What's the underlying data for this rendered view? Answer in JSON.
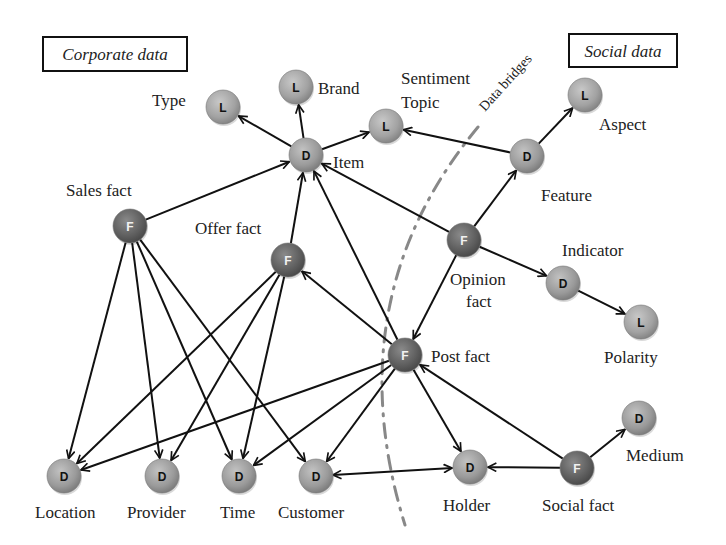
{
  "diagram": {
    "regions": {
      "corporate": {
        "label": "Corporate data",
        "x": 43,
        "y": 37,
        "w": 144,
        "h": 34
      },
      "social": {
        "label": "Social data",
        "x": 569,
        "y": 34,
        "w": 108,
        "h": 33
      }
    },
    "bridge": {
      "label": "Data bridges",
      "points": [
        [
          478,
          127
        ],
        [
          335,
          300
        ],
        [
          405,
          525
        ]
      ],
      "label_x": 485,
      "label_y": 112,
      "label_angle": -48
    },
    "colors": {
      "fact_node": "#6a6a6a",
      "dimension_node": "#a0a0a0",
      "level_node": "#a8a8a8",
      "edge": "#111111",
      "bridge": "#888888",
      "text": "#222222"
    },
    "nodes": [
      {
        "id": "type",
        "kind": "L",
        "letter": "L",
        "x": 223,
        "y": 107,
        "label": "Type",
        "lx": 152,
        "ly": 106
      },
      {
        "id": "brand",
        "kind": "L",
        "letter": "L",
        "x": 296,
        "y": 87,
        "label": "Brand",
        "lx": 318,
        "ly": 94
      },
      {
        "id": "item",
        "kind": "D",
        "letter": "D",
        "x": 306,
        "y": 155,
        "label": "Item",
        "lx": 333,
        "ly": 168
      },
      {
        "id": "sentiment-topic",
        "kind": "L",
        "letter": "L",
        "x": 386,
        "y": 126,
        "label": "Sentiment",
        "label2": "Topic",
        "lx": 401,
        "ly": 84,
        "ly2": 108
      },
      {
        "id": "aspect",
        "kind": "L",
        "letter": "L",
        "x": 585,
        "y": 95,
        "label": "Aspect",
        "lx": 599,
        "ly": 130
      },
      {
        "id": "feature",
        "kind": "D",
        "letter": "D",
        "x": 527,
        "y": 156,
        "label": "Feature",
        "lx": 541,
        "ly": 201
      },
      {
        "id": "sales-fact",
        "kind": "F",
        "letter": "F",
        "x": 130,
        "y": 226,
        "label": "Sales fact",
        "lx": 66,
        "ly": 196
      },
      {
        "id": "offer-fact",
        "kind": "F",
        "letter": "F",
        "x": 288,
        "y": 260,
        "label": "Offer fact",
        "lx": 195,
        "ly": 234
      },
      {
        "id": "opinion-fact",
        "kind": "F",
        "letter": "F",
        "x": 464,
        "y": 240,
        "label": "Opinion",
        "label2": "fact",
        "lx": 450,
        "ly": 285,
        "ly2": 307
      },
      {
        "id": "indicator",
        "kind": "D",
        "letter": "D",
        "x": 563,
        "y": 283,
        "label": "Indicator",
        "lx": 562,
        "ly": 256
      },
      {
        "id": "polarity",
        "kind": "L",
        "letter": "L",
        "x": 641,
        "y": 322,
        "label": "Polarity",
        "lx": 604,
        "ly": 363
      },
      {
        "id": "post-fact",
        "kind": "F",
        "letter": "F",
        "x": 405,
        "y": 355,
        "label": "Post fact",
        "lx": 431,
        "ly": 362
      },
      {
        "id": "location",
        "kind": "D",
        "letter": "D",
        "x": 64,
        "y": 476,
        "label": "Location",
        "lx": 35,
        "ly": 518
      },
      {
        "id": "provider",
        "kind": "D",
        "letter": "D",
        "x": 162,
        "y": 476,
        "label": "Provider",
        "lx": 127,
        "ly": 518
      },
      {
        "id": "time",
        "kind": "D",
        "letter": "D",
        "x": 239,
        "y": 476,
        "label": "Time",
        "lx": 220,
        "ly": 518
      },
      {
        "id": "customer",
        "kind": "D",
        "letter": "D",
        "x": 316,
        "y": 476,
        "label": "Customer",
        "lx": 278,
        "ly": 518
      },
      {
        "id": "holder",
        "kind": "D",
        "letter": "D",
        "x": 470,
        "y": 467,
        "label": "Holder",
        "lx": 443,
        "ly": 511
      },
      {
        "id": "social-fact",
        "kind": "F",
        "letter": "F",
        "x": 577,
        "y": 468,
        "label": "Social fact",
        "lx": 542,
        "ly": 511
      },
      {
        "id": "medium",
        "kind": "D",
        "letter": "D",
        "x": 639,
        "y": 418,
        "label": "Medium",
        "lx": 626,
        "ly": 461
      }
    ],
    "edges": [
      {
        "from": "item",
        "to": "type"
      },
      {
        "from": "item",
        "to": "brand"
      },
      {
        "from": "item",
        "to": "sentiment-topic"
      },
      {
        "from": "feature",
        "to": "sentiment-topic"
      },
      {
        "from": "feature",
        "to": "aspect"
      },
      {
        "from": "sales-fact",
        "to": "item"
      },
      {
        "from": "offer-fact",
        "to": "item"
      },
      {
        "from": "opinion-fact",
        "to": "item"
      },
      {
        "from": "post-fact",
        "to": "item"
      },
      {
        "from": "opinion-fact",
        "to": "feature"
      },
      {
        "from": "opinion-fact",
        "to": "indicator"
      },
      {
        "from": "indicator",
        "to": "polarity"
      },
      {
        "from": "opinion-fact",
        "to": "post-fact"
      },
      {
        "from": "post-fact",
        "to": "offer-fact"
      },
      {
        "from": "sales-fact",
        "to": "location"
      },
      {
        "from": "sales-fact",
        "to": "provider"
      },
      {
        "from": "sales-fact",
        "to": "time"
      },
      {
        "from": "sales-fact",
        "to": "customer"
      },
      {
        "from": "offer-fact",
        "to": "location"
      },
      {
        "from": "offer-fact",
        "to": "provider"
      },
      {
        "from": "offer-fact",
        "to": "time"
      },
      {
        "from": "post-fact",
        "to": "location"
      },
      {
        "from": "post-fact",
        "to": "time"
      },
      {
        "from": "post-fact",
        "to": "customer"
      },
      {
        "from": "post-fact",
        "to": "holder"
      },
      {
        "from": "social-fact",
        "to": "post-fact"
      },
      {
        "from": "social-fact",
        "to": "holder"
      },
      {
        "from": "social-fact",
        "to": "medium"
      },
      {
        "from": "customer",
        "to": "holder",
        "bidirectional": true
      }
    ]
  }
}
